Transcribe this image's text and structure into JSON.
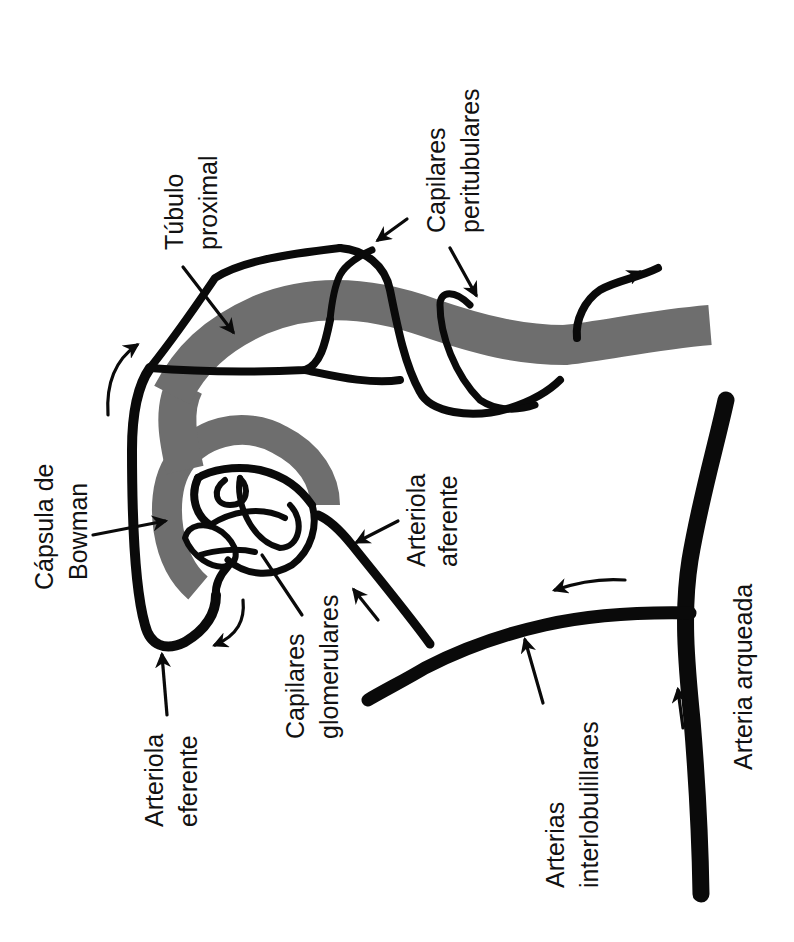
{
  "figure": {
    "orientation": "rotated -90deg",
    "colors": {
      "vessel": "#0a0a0a",
      "tubule": "#6e6e6e",
      "background": "#ffffff",
      "text": "#111111"
    }
  },
  "labels": {
    "tubulo_proximal": {
      "line1": "Túbulo",
      "line2": "proximal"
    },
    "capilares_peritubulares": {
      "line1": "Capilares",
      "line2": "peritubulares"
    },
    "capsula_bowman": {
      "line1": "Cápsula de",
      "line2": "Bowman"
    },
    "arteriola_aferente": {
      "line1": "Arteriola",
      "line2": "aferente"
    },
    "arteriola_eferente": {
      "line1": "Arteriola",
      "line2": "eferente"
    },
    "capilares_glomerulares": {
      "line1": "Capilares",
      "line2": "glomerulares"
    },
    "arterias_interlobulillares": {
      "line1": "Arterias",
      "line2": "interlobulillares"
    },
    "arteria_arqueada": {
      "line1": "Arteria arqueada"
    }
  },
  "flow_arrows": [
    "arqueada-to-interlobulillar",
    "interlobulillar-to-aferente",
    "aferente-to-glomerulo",
    "glomerulo-to-eferente",
    "eferente-to-peritubulares",
    "peritubulares-outflow"
  ]
}
